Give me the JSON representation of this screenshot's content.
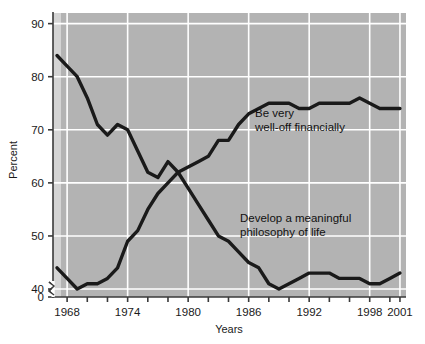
{
  "chart_data": {
    "type": "line",
    "title": "",
    "xlabel": "Years",
    "ylabel": "Percent",
    "xlim": [
      1966.6,
      2001.6
    ],
    "ylim": [
      38.5,
      92
    ],
    "ytick_values": [
      0,
      40,
      50,
      60,
      70,
      80,
      90
    ],
    "ytick_labels": [
      "0",
      "40",
      "50",
      "60",
      "70",
      "80",
      "90"
    ],
    "y_axis_break": true,
    "y_axis_break_note": "axis break between 0 and 40",
    "xtick_values": [
      1968,
      1970,
      1972,
      1974,
      1976,
      1978,
      1980,
      1982,
      1984,
      1986,
      1988,
      1990,
      1992,
      1994,
      1996,
      1998,
      2000,
      2001
    ],
    "xtick_labeled": [
      1968,
      1974,
      1980,
      1986,
      1992,
      1998,
      2001
    ],
    "xtick_labels": [
      "1968",
      "1974",
      "1980",
      "1986",
      "1992",
      "1998",
      "2001"
    ],
    "grid": true,
    "grid_color": "#ffffff",
    "plot_background": "#b3b3b3",
    "line_color": "#1a1a1a",
    "legend": "annotations-inline",
    "series": [
      {
        "name": "Be very well-off financially",
        "annotation": [
          "Be very",
          "well-off financially"
        ],
        "x": [
          1967,
          1968,
          1969,
          1970,
          1971,
          1972,
          1973,
          1974,
          1975,
          1976,
          1977,
          1978,
          1979,
          1980,
          1981,
          1982,
          1983,
          1984,
          1985,
          1986,
          1987,
          1988,
          1989,
          1990,
          1991,
          1992,
          1993,
          1994,
          1995,
          1996,
          1997,
          1998,
          1999,
          2000,
          2001
        ],
        "values": [
          44,
          42,
          40,
          41,
          41,
          42,
          44,
          49,
          51,
          55,
          58,
          60,
          62,
          63,
          64,
          65,
          68,
          68,
          71,
          73,
          74,
          75,
          75,
          75,
          74,
          74,
          75,
          75,
          75,
          75,
          76,
          75,
          74,
          74,
          74
        ]
      },
      {
        "name": "Develop a meaningful philosophy of life",
        "annotation": [
          "Develop a meaningful",
          "philosophy of life"
        ],
        "x": [
          1967,
          1968,
          1969,
          1970,
          1971,
          1972,
          1973,
          1974,
          1975,
          1976,
          1977,
          1978,
          1979,
          1980,
          1981,
          1982,
          1983,
          1984,
          1985,
          1986,
          1987,
          1988,
          1989,
          1990,
          1991,
          1992,
          1993,
          1994,
          1995,
          1996,
          1997,
          1998,
          1999,
          2000,
          2001
        ],
        "values": [
          84,
          82,
          80,
          76,
          71,
          69,
          71,
          70,
          66,
          62,
          61,
          64,
          62,
          59,
          56,
          53,
          50,
          49,
          47,
          45,
          44,
          41,
          40,
          41,
          42,
          43,
          43,
          43,
          42,
          42,
          42,
          41,
          41,
          42,
          43
        ]
      }
    ]
  },
  "axes": {
    "ylabel": "Percent",
    "xlabel": "Years"
  }
}
